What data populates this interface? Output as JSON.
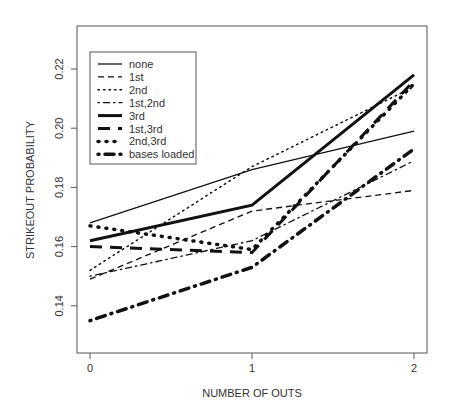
{
  "chart_data": {
    "type": "line",
    "title": "",
    "xlabel": "NUMBER OF OUTS",
    "ylabel": "STRIKEOUT PROBABILITY",
    "x": [
      0,
      1,
      2
    ],
    "x_ticks": [
      "0",
      "1",
      "2"
    ],
    "y_ticks": [
      "0.14",
      "0.16",
      "0.18",
      "0.20",
      "0.22"
    ],
    "ylim": [
      0.128,
      0.233
    ],
    "grid": false,
    "legend_position": "top-left",
    "series": [
      {
        "name": "none",
        "values": [
          0.168,
          0.186,
          0.199
        ],
        "style": "solid",
        "width": 1.3
      },
      {
        "name": "1st",
        "values": [
          0.149,
          0.172,
          0.179
        ],
        "style": "dash",
        "width": 1.3
      },
      {
        "name": "2nd",
        "values": [
          0.152,
          0.187,
          0.214
        ],
        "style": "dot",
        "width": 1.5
      },
      {
        "name": "1st,2nd",
        "values": [
          0.15,
          0.162,
          0.189
        ],
        "style": "dotdash",
        "width": 1.3
      },
      {
        "name": "3rd",
        "values": [
          0.162,
          0.174,
          0.218
        ],
        "style": "solid",
        "width": 3
      },
      {
        "name": "1st,3rd",
        "values": [
          0.16,
          0.158,
          0.216
        ],
        "style": "longdash",
        "width": 3
      },
      {
        "name": "2nd,3rd",
        "values": [
          0.167,
          0.159,
          0.215
        ],
        "style": "dot",
        "width": 3.5
      },
      {
        "name": "bases loaded",
        "values": [
          0.135,
          0.153,
          0.193
        ],
        "style": "dotdash",
        "width": 3.5
      }
    ]
  }
}
